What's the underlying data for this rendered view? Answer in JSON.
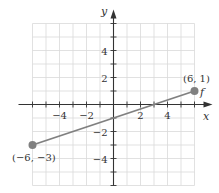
{
  "chart_data": {
    "type": "line",
    "title": "",
    "xlabel": "x",
    "ylabel": "y",
    "function_label": "f",
    "xlim": [
      -6,
      6
    ],
    "ylim": [
      -6,
      6
    ],
    "grid": true,
    "x_ticks": [
      -6,
      -5,
      -4,
      -3,
      -2,
      -1,
      1,
      2,
      3,
      4,
      5,
      6
    ],
    "y_ticks": [
      -6,
      -5,
      -4,
      -3,
      -2,
      -1,
      1,
      2,
      3,
      4,
      5,
      6
    ],
    "x_tick_labels": [
      "−4",
      "−2",
      "2",
      "4"
    ],
    "y_tick_labels": [
      "4",
      "2",
      "−2",
      "−4"
    ],
    "series": [
      {
        "name": "f",
        "x": [
          -6,
          6
        ],
        "y": [
          -3,
          1
        ],
        "color": "#808080"
      }
    ],
    "annotations": [
      {
        "text": "(−6, −3)",
        "x": -6,
        "y": -3
      },
      {
        "text": "(6, 1)",
        "x": 6,
        "y": 1
      }
    ]
  }
}
